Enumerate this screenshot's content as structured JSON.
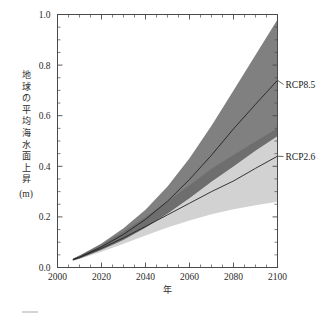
{
  "chart_data": {
    "type": "area",
    "title": "",
    "xlabel": "年",
    "ylabel": "地球の平均海水面上昇 (m)",
    "ylabel_main": "地球の平均海水面上昇",
    "ylabel_unit": "(m)",
    "xlim": [
      2000,
      2100
    ],
    "ylim": [
      0.0,
      1.0
    ],
    "grid": false,
    "legend_position": "right-inline",
    "x_ticks": [
      2000,
      2020,
      2040,
      2060,
      2080,
      2100
    ],
    "x_tick_labels": [
      "2000",
      "2020",
      "2040",
      "2060",
      "2080",
      "2100"
    ],
    "x_minor_step": 5,
    "y_ticks": [
      0.0,
      0.2,
      0.4,
      0.6,
      0.8,
      1.0
    ],
    "y_tick_labels": [
      "0.0",
      "0.2",
      "0.4",
      "0.6",
      "0.8",
      "1.0"
    ],
    "y_minor_step": 0.05,
    "x": [
      2007,
      2010,
      2020,
      2030,
      2040,
      2050,
      2060,
      2070,
      2080,
      2090,
      2100
    ],
    "series": [
      {
        "name": "RCP8.5",
        "label": "RCP8.5",
        "color": "#808080",
        "band_upper": [
          0.035,
          0.047,
          0.095,
          0.155,
          0.228,
          0.32,
          0.432,
          0.56,
          0.7,
          0.84,
          0.98
        ],
        "band_lower": [
          0.028,
          0.036,
          0.07,
          0.11,
          0.158,
          0.213,
          0.275,
          0.34,
          0.4,
          0.462,
          0.52
        ],
        "median": [
          0.031,
          0.041,
          0.082,
          0.131,
          0.19,
          0.262,
          0.348,
          0.444,
          0.548,
          0.645,
          0.74
        ]
      },
      {
        "name": "RCP2.6",
        "label": "RCP2.6",
        "color": "#d2d2d2",
        "band_upper": [
          0.035,
          0.046,
          0.09,
          0.142,
          0.2,
          0.262,
          0.325,
          0.39,
          0.445,
          0.498,
          0.55
        ],
        "band_lower": [
          0.028,
          0.034,
          0.062,
          0.094,
          0.126,
          0.158,
          0.186,
          0.21,
          0.23,
          0.246,
          0.26
        ],
        "median": [
          0.031,
          0.04,
          0.076,
          0.117,
          0.162,
          0.208,
          0.254,
          0.3,
          0.342,
          0.392,
          0.44
        ]
      }
    ]
  },
  "labels": {
    "rcp85": "RCP8.5",
    "rcp26": "RCP2.6",
    "x_axis_title": "年",
    "y_axis_title_chars": [
      "地",
      "球",
      "の",
      "平",
      "均",
      "海",
      "水",
      "面",
      "上",
      "昇"
    ],
    "y_axis_unit": "(m)"
  },
  "colors": {
    "band_rcp85": "#808080",
    "band_rcp26": "#d2d2d2",
    "band_overlap": "#6e6e6e",
    "median": "#222222",
    "axis": "#4a4a4a",
    "background": "#ffffff"
  }
}
